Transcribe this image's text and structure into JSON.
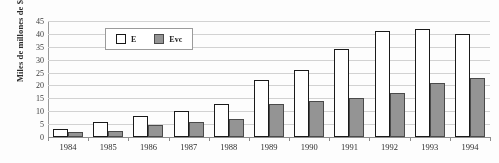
{
  "chart_data": {
    "type": "bar",
    "title": "",
    "xlabel": "",
    "ylabel": "Miles de millones de $",
    "ylim": [
      0,
      45
    ],
    "yticks": [
      0,
      5,
      10,
      15,
      20,
      25,
      30,
      35,
      40,
      45
    ],
    "grid": true,
    "legend_position": "top-left-inside",
    "categories": [
      "1984",
      "1985",
      "1986",
      "1987",
      "1988",
      "1989",
      "1990",
      "1991",
      "1992",
      "1993",
      "1994"
    ],
    "series": [
      {
        "name": "E",
        "color": "#ffffff",
        "edge_color": "#1a1a1a",
        "values": [
          3,
          6,
          8,
          10,
          13,
          22,
          26,
          34,
          41,
          42,
          40
        ]
      },
      {
        "name": "Evc",
        "color": "#949494",
        "edge_color": "#4a4a4a",
        "values": [
          2,
          2.5,
          4.5,
          6,
          7,
          13,
          14,
          15,
          17,
          21,
          23
        ]
      }
    ]
  },
  "axes": {
    "y_title": "Miles de millones de $",
    "y_tick_labels": [
      "45",
      "40",
      "35",
      "30",
      "25",
      "20",
      "15",
      "10",
      "5",
      "0"
    ],
    "x_tick_labels": [
      "1984",
      "1985",
      "1986",
      "1987",
      "1988",
      "1989",
      "1990",
      "1991",
      "1992",
      "1993",
      "1994"
    ]
  },
  "legend": {
    "entries": [
      {
        "label": "E",
        "swatch": "white-square-outlined"
      },
      {
        "label": "Evc",
        "swatch": "gray-filled-square"
      }
    ]
  }
}
